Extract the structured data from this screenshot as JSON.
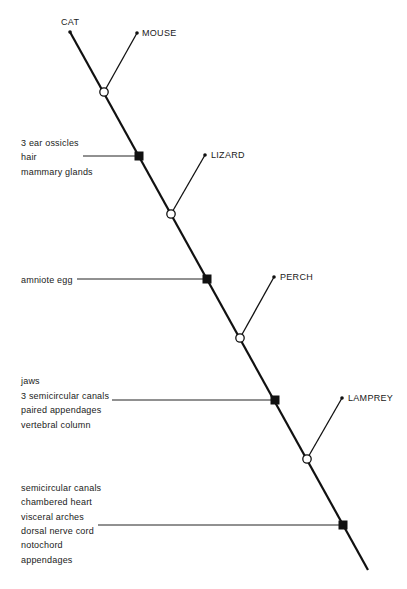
{
  "diagram": {
    "type": "cladogram",
    "taxa": [
      {
        "name": "CAT",
        "x": 70,
        "y": 32,
        "label_x": 61,
        "label_y": 18
      },
      {
        "name": "MOUSE",
        "x": 137,
        "y": 33,
        "label_x": 142,
        "label_y": 28
      },
      {
        "name": "LIZARD",
        "x": 205,
        "y": 155,
        "label_x": 211,
        "label_y": 150
      },
      {
        "name": "PERCH",
        "x": 274,
        "y": 277,
        "label_x": 280,
        "label_y": 272
      },
      {
        "name": "LAMPREY",
        "x": 342,
        "y": 398,
        "label_x": 348,
        "label_y": 393
      }
    ],
    "branch_points": [
      {
        "x": 104,
        "y": 92
      },
      {
        "x": 171,
        "y": 214
      },
      {
        "x": 240,
        "y": 338
      },
      {
        "x": 307,
        "y": 459
      }
    ],
    "main_line": {
      "x1": 70,
      "y1": 32,
      "x2": 368,
      "y2": 570
    },
    "characters": [
      {
        "node_x": 139,
        "node_y": 156,
        "line_x1": 83,
        "traits": [
          "3 ear ossicles",
          "hair",
          "mammary glands"
        ],
        "text_y": 138
      },
      {
        "node_x": 207,
        "node_y": 279,
        "line_x1": 77,
        "traits": [
          "amniote egg"
        ],
        "text_y": 275
      },
      {
        "node_x": 275,
        "node_y": 400,
        "line_x1": 112,
        "traits": [
          "jaws",
          "3 semicircular canals",
          "paired appendages",
          "vertebral column"
        ],
        "text_y": 376
      },
      {
        "node_x": 343,
        "node_y": 525,
        "line_x1": 98,
        "traits": [
          "semicircular canals",
          "chambered heart",
          "visceral arches",
          "dorsal nerve cord",
          "notochord",
          "appendages"
        ],
        "text_y": 483
      }
    ]
  },
  "labels": {
    "cat": "CAT",
    "mouse": "MOUSE",
    "lizard": "LIZARD",
    "perch": "PERCH",
    "lamprey": "LAMPREY",
    "group1": [
      "3 ear ossicles",
      "hair",
      "mammary glands"
    ],
    "group2": [
      "amniote egg"
    ],
    "group3": [
      "jaws",
      "3 semicircular canals",
      "paired appendages",
      "vertebral column"
    ],
    "group4": [
      "semicircular canals",
      "chambered heart",
      "visceral arches",
      "dorsal nerve cord",
      "notochord",
      "appendages"
    ]
  }
}
